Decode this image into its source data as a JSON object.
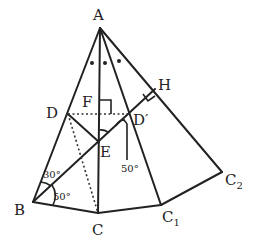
{
  "diagram": {
    "type": "geometry",
    "points": {
      "A": {
        "label": "A",
        "x": 100,
        "y": 28
      },
      "B": {
        "label": "B",
        "x": 33,
        "y": 202
      },
      "C": {
        "label": "C",
        "x": 98,
        "y": 213
      },
      "C1": {
        "label": "C",
        "sub": "1",
        "x": 161,
        "y": 205
      },
      "C2": {
        "label": "C",
        "sub": "2",
        "x": 222,
        "y": 172
      },
      "D": {
        "label": "D",
        "x": 68,
        "y": 114
      },
      "Dp": {
        "label": "D′",
        "x": 131,
        "y": 114
      },
      "E": {
        "label": "E",
        "x": 99,
        "y": 142
      },
      "F": {
        "label": "F",
        "x": 99,
        "y": 114
      },
      "H": {
        "label": "H",
        "x": 152,
        "y": 92
      }
    },
    "angles": {
      "angle_DBE": "30°",
      "angle_EBC": "50°",
      "angle_at_Dp": "50°"
    }
  }
}
